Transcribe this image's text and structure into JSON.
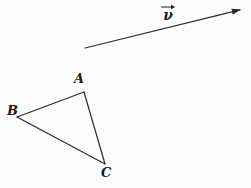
{
  "figure": {
    "name": "vector-and-triangle-geometry-figure",
    "background_color": "#fdfdfd",
    "stroke_color": "#2b2b2b",
    "label_color": "#1c1c1c",
    "width": 251,
    "height": 188
  },
  "vector": {
    "label_glyph": "ν",
    "label_overbar_icon": "vector-arrow-overbar-icon",
    "label_x": 166,
    "label_y": 12,
    "start_x": 85,
    "start_y": 48,
    "end_x": 244,
    "end_y": 9,
    "stroke_width": 1.2,
    "arrowhead": "solid-triangle"
  },
  "triangle": {
    "vertices": [
      {
        "name": "A",
        "x": 84,
        "y": 92,
        "label_x": 78,
        "label_y": 79
      },
      {
        "name": "B",
        "x": 17,
        "y": 117,
        "label_x": 11,
        "label_y": 111
      },
      {
        "name": "C",
        "x": 105,
        "y": 164,
        "label_x": 106,
        "label_y": 173
      }
    ],
    "edges": [
      {
        "name": "edge-AB",
        "from": "A",
        "to": "B"
      },
      {
        "name": "edge-AC",
        "from": "A",
        "to": "C"
      },
      {
        "name": "edge-BC",
        "from": "B",
        "to": "C"
      }
    ],
    "stroke_width": 1.2,
    "path": "M 84 92 L 17 117 L 105 164 Z"
  },
  "labels": {
    "vertex_a": "A",
    "vertex_b": "B",
    "vertex_c": "C",
    "vector_v": "ν"
  }
}
